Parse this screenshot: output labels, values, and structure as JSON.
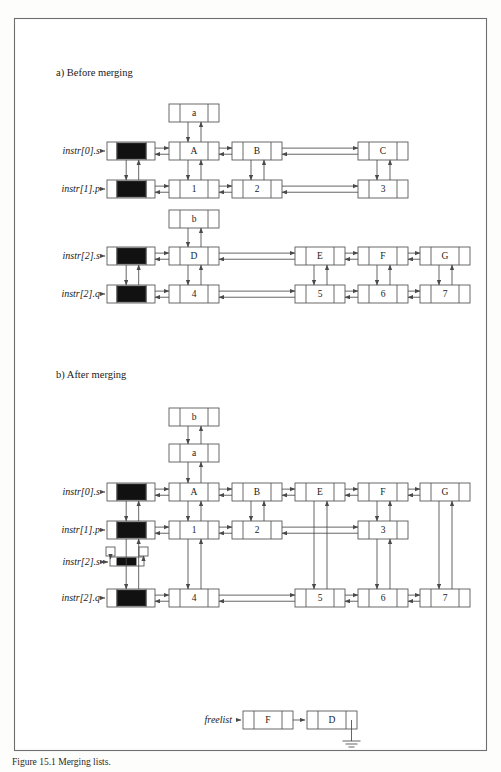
{
  "figure": {
    "caption": "Figure 15.1  Merging lists.",
    "panels": [
      {
        "id": "a",
        "label": "a) Before merging"
      },
      {
        "id": "b",
        "label": "b) After merging"
      }
    ]
  },
  "colors": {
    "ink": "#1a1a1a",
    "line": "#4a4a4a",
    "cell_stroke": "#5a5a5a",
    "filled_cell": "#111111",
    "frame": "#6f6f6f",
    "paper": "#ffffff"
  },
  "geometry": {
    "node_width": 50,
    "node_height": 18,
    "ptr_cell_width": 11,
    "header_width": 48,
    "columns": [
      169,
      232,
      295,
      358,
      420
    ],
    "header_x": 107
  },
  "panel_a": {
    "label": "a) Before merging",
    "group1": {
      "rows": [
        {
          "pointer_label": "instr[0].s",
          "header": "sentinel",
          "y": 142,
          "nodes": [
            {
              "value": "A",
              "col": 0
            },
            {
              "value": "B",
              "col": 1
            },
            {
              "value": "C",
              "col": 3
            }
          ]
        },
        {
          "pointer_label": "instr[1].p",
          "header": "sentinel",
          "y": 180,
          "nodes": [
            {
              "value": "1",
              "col": 0
            },
            {
              "value": "2",
              "col": 1
            },
            {
              "value": "3",
              "col": 3
            }
          ]
        }
      ],
      "floating": [
        {
          "value": "a",
          "x": 169,
          "y": 104,
          "links_to_col": 0
        }
      ]
    },
    "group2": {
      "rows": [
        {
          "pointer_label": "instr[2].s",
          "header": "sentinel",
          "y": 247,
          "nodes": [
            {
              "value": "D",
              "col": 0
            },
            {
              "value": "E",
              "col": 2
            },
            {
              "value": "F",
              "col": 3
            },
            {
              "value": "G",
              "col": 4
            }
          ]
        },
        {
          "pointer_label": "instr[2].q",
          "header": "sentinel",
          "y": 285,
          "nodes": [
            {
              "value": "4",
              "col": 0
            },
            {
              "value": "5",
              "col": 2
            },
            {
              "value": "6",
              "col": 3
            },
            {
              "value": "7",
              "col": 4
            }
          ]
        }
      ],
      "floating": [
        {
          "value": "b",
          "x": 169,
          "y": 210,
          "links_to_col": 0
        }
      ]
    }
  },
  "panel_b": {
    "label": "b) After merging",
    "floating": [
      {
        "value": "b",
        "x": 169,
        "y": 408
      },
      {
        "value": "a",
        "x": 169,
        "y": 444
      }
    ],
    "rows": [
      {
        "pointer_label": "instr[0].s",
        "header": "sentinel",
        "y": 483,
        "nodes": [
          {
            "value": "A",
            "col": 0
          },
          {
            "value": "B",
            "col": 1
          },
          {
            "value": "E",
            "col": 2
          },
          {
            "value": "F",
            "col": 3
          },
          {
            "value": "G",
            "col": 4
          }
        ]
      },
      {
        "pointer_label": "instr[1].p",
        "header": "sentinel",
        "y": 521,
        "nodes": [
          {
            "value": "1",
            "col": 0
          },
          {
            "value": "2",
            "col": 1
          },
          {
            "value": "3",
            "col": 3
          }
        ]
      },
      {
        "pointer_label": "instr[2].s",
        "header": "empty-sentinel",
        "y": 553,
        "nodes": []
      },
      {
        "pointer_label": "instr[2].q",
        "header": "sentinel",
        "y": 589,
        "nodes": [
          {
            "value": "4",
            "col": 0
          },
          {
            "value": "5",
            "col": 2
          },
          {
            "value": "6",
            "col": 3
          },
          {
            "value": "7",
            "col": 4
          }
        ]
      }
    ]
  },
  "freelist": {
    "pointer_label": "freelist",
    "y": 711,
    "nodes": [
      {
        "value": "F",
        "x": 243
      },
      {
        "value": "D",
        "x": 307
      }
    ],
    "terminator": "ground"
  }
}
